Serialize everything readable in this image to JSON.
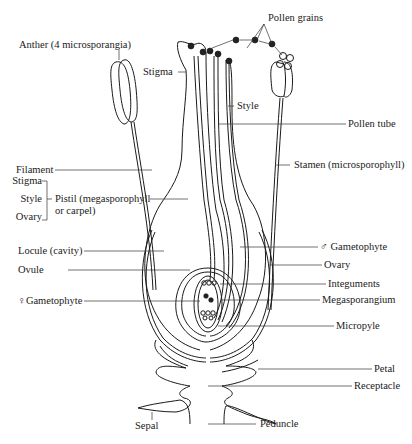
{
  "figure": {
    "type": "labelled botanical diagram"
  },
  "labels": {
    "anther": "Anther (4 microsporangia)",
    "pollen_grains": "Pollen grains",
    "stigma_top": "Stigma",
    "style_top": "Style",
    "pollen_tube": "Pollen tube",
    "filament": "Filament",
    "stamen": "Stamen (microsporophyll)",
    "pistil_parts": {
      "stigma": "Stigma",
      "style": "Style",
      "ovary": "Ovary"
    },
    "pistil_line1": "Pistil (megasporophyll",
    "pistil_line2": "or carpel)",
    "locule": "Locule (cavity)",
    "male_gametophyte": "♂ Gametophyte",
    "ovary": "Ovary",
    "ovule": "Ovule",
    "integuments": "Integuments",
    "female_gametophyte": "♀Gametophyte",
    "megasporangium": "Megasporangium",
    "micropyle": "Micropyle",
    "petal": "Petal",
    "receptacle": "Receptacle",
    "sepal": "Sepal",
    "peduncle": "Peduncle"
  },
  "colors": {
    "ink": "#1a1a1a",
    "background": "#ffffff"
  }
}
